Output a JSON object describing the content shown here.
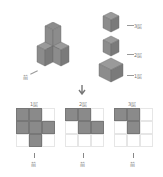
{
  "left_figure": {
    "front_label": "前"
  },
  "right_figure": {
    "layers": [
      {
        "label": "3层"
      },
      {
        "label": "2层"
      },
      {
        "label": "1层"
      }
    ]
  },
  "down_arrow": "arrow-down-icon",
  "top_views": [
    {
      "label": "1层",
      "front_label": "前",
      "cells": [
        1,
        1,
        0,
        1,
        1,
        1,
        0,
        1,
        0
      ]
    },
    {
      "label": "2层",
      "front_label": "前",
      "cells": [
        1,
        1,
        0,
        0,
        1,
        1,
        0,
        0,
        0
      ]
    },
    {
      "label": "3层",
      "front_label": "前",
      "cells": [
        1,
        1,
        0,
        0,
        1,
        0,
        0,
        0,
        0
      ]
    }
  ],
  "colors": {
    "cube": "#8c8c8c",
    "cell_filled": "#8a8a8a",
    "grid_line": "#e6e6e6"
  }
}
